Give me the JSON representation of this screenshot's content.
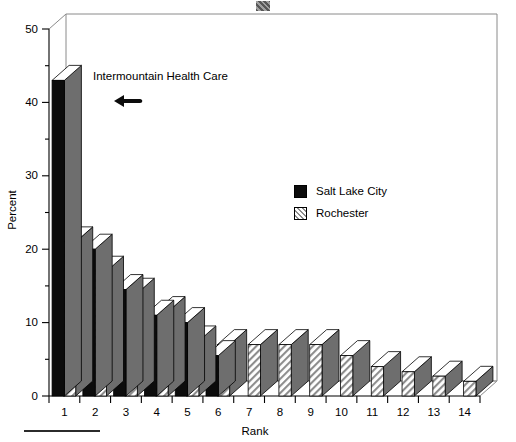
{
  "chart_data": {
    "type": "bar",
    "title": "",
    "subtitle": "",
    "xlabel": "Rank",
    "ylabel": "Percent",
    "categories": [
      "1",
      "2",
      "3",
      "4",
      "5",
      "6",
      "7",
      "8",
      "9",
      "10",
      "11",
      "12",
      "13",
      "14"
    ],
    "ylim": [
      0,
      50
    ],
    "yticks": [
      0,
      10,
      20,
      30,
      40,
      50
    ],
    "yticks_minor": [
      5,
      15,
      25,
      35,
      45
    ],
    "xtick_labels": [
      "1",
      "2",
      "3",
      "4",
      "5",
      "6",
      "7",
      "8",
      "9",
      "10",
      "11",
      "12",
      "13",
      "14"
    ],
    "grid": false,
    "legend_position": "upper-right-inside",
    "style": "3d-vertical-bars",
    "series": [
      {
        "name": "Salt Lake City",
        "fill": "solid-black",
        "color": "#0c0c0c",
        "values": [
          43,
          20,
          14.5,
          11,
          10,
          5.5,
          null,
          null,
          null,
          null,
          null,
          null,
          null,
          null
        ]
      },
      {
        "name": "Rochester",
        "fill": "hatched",
        "color": "#8d8d8d",
        "values": [
          21,
          17,
          14,
          11.5,
          7.5,
          7,
          7,
          7,
          7,
          5.5,
          4,
          3.3,
          2.7,
          2
        ]
      }
    ],
    "annotations": [
      {
        "text": "Intermountain Health Care",
        "arrow": "left-arrow",
        "points_to": "rank-1-salt-lake-city-bar"
      }
    ]
  },
  "axes": {
    "y_title": "Percent",
    "x_title": "Rank",
    "y_tick_labels": [
      "0",
      "10",
      "20",
      "30",
      "40",
      "50"
    ],
    "x_tick_labels": [
      "1",
      "2",
      "3",
      "4",
      "5",
      "6",
      "7",
      "8",
      "9",
      "10",
      "11",
      "12",
      "13",
      "14"
    ]
  },
  "legend": {
    "items": [
      {
        "label": "Salt Lake City",
        "swatch": "solid-black"
      },
      {
        "label": "Rochester",
        "swatch": "diagonal-hatch"
      }
    ]
  },
  "annotation": {
    "label": "Intermountain Health Care",
    "arrow_icon": "left-arrow-icon"
  },
  "colors": {
    "bar_dark": "#0c0c0c",
    "bar_side": "#6e6e6e",
    "bar_top": "#ffffff",
    "hatch": "#8d8d8d",
    "frame": "#8a8a8a",
    "axis": "#000000"
  }
}
